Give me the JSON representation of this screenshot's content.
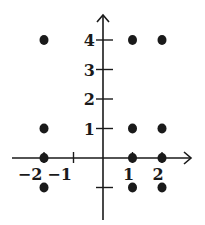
{
  "chart_data": {
    "type": "scatter",
    "title": "",
    "xlabel": "",
    "ylabel": "",
    "xlim": [
      -2.3,
      2.8
    ],
    "ylim": [
      -1.5,
      4.7
    ],
    "grid": false,
    "legend": null,
    "x_ticks": [
      -2,
      -1,
      1,
      2
    ],
    "x_tick_labels": [
      "−2",
      "−1",
      "1",
      "2"
    ],
    "y_ticks": [
      -1,
      1,
      2,
      3,
      4
    ],
    "y_tick_labels": [
      "",
      "1",
      "2",
      "3",
      "4"
    ],
    "series": [
      {
        "name": "points",
        "points": [
          {
            "x": -2,
            "y": 4
          },
          {
            "x": -2,
            "y": 1
          },
          {
            "x": -2,
            "y": 0
          },
          {
            "x": -2,
            "y": -1
          },
          {
            "x": 1,
            "y": 4
          },
          {
            "x": 1,
            "y": 1
          },
          {
            "x": 1,
            "y": 0
          },
          {
            "x": 1,
            "y": -1
          },
          {
            "x": 2,
            "y": 4
          },
          {
            "x": 2,
            "y": 1
          },
          {
            "x": 2,
            "y": 0
          },
          {
            "x": 2,
            "y": -1
          }
        ]
      }
    ],
    "colors": {
      "ink": "#1a1a1a",
      "background": "#ffffff"
    }
  }
}
